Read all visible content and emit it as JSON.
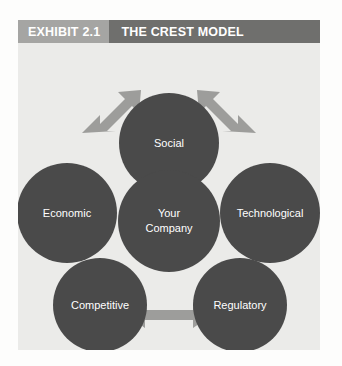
{
  "header": {
    "exhibit_tag": "EXHIBIT 2.1",
    "title": "THE CREST MODEL"
  },
  "diagram": {
    "center_node": {
      "label_line1": "Your",
      "label_line2": "Company"
    },
    "nodes": [
      {
        "id": "social",
        "label": "Social"
      },
      {
        "id": "technological",
        "label": "Technological"
      },
      {
        "id": "regulatory",
        "label": "Regulatory"
      },
      {
        "id": "competitive",
        "label": "Competitive"
      },
      {
        "id": "economic",
        "label": "Economic"
      }
    ],
    "connectors": [
      {
        "id": "economic-social",
        "from": "Economic",
        "to": "Social"
      },
      {
        "id": "social-technological",
        "from": "Social",
        "to": "Technological"
      },
      {
        "id": "technological-regulatory",
        "from": "Technological",
        "to": "Regulatory"
      },
      {
        "id": "regulatory-competitive",
        "from": "Regulatory",
        "to": "Competitive"
      },
      {
        "id": "competitive-economic",
        "from": "Competitive",
        "to": "Economic"
      }
    ]
  },
  "colors": {
    "node_fill": "#4a4a4a",
    "arrow_fill": "#9d9d9b",
    "panel_background": "#ebebe9",
    "header_tag_background": "#a5a5a3",
    "header_title_background": "#6f6f6d",
    "node_text": "#ffffff"
  }
}
